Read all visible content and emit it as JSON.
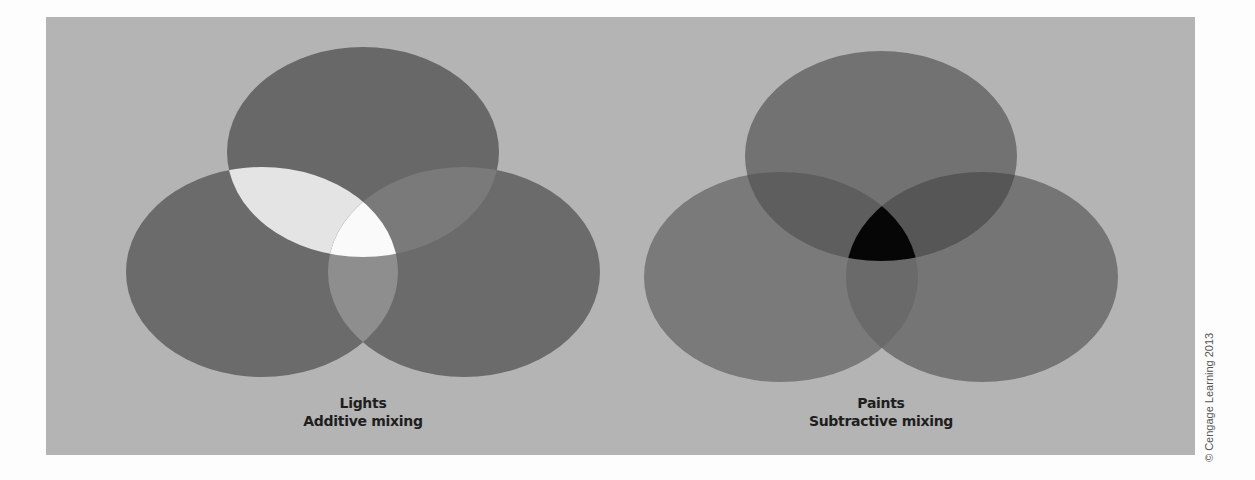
{
  "figure": {
    "background_color": "#b4b4b4",
    "page_color": "#fdfdfd",
    "credit": "© Cengage Learning 2013"
  },
  "diagrams": [
    {
      "id": "additive",
      "title": "Lights",
      "subtitle": "Additive mixing",
      "circle_color": "#6b6b6b",
      "pair_colors": {
        "top_left": "#e6e6e6",
        "top_right": "#7a7a7a",
        "left_right": "#8e8e8e"
      },
      "center_color": "#fafafa"
    },
    {
      "id": "subtractive",
      "title": "Paints",
      "subtitle": "Subtractive mixing",
      "circle_color": "#787878",
      "pair_colors": {
        "top_left": "#5c5c5c",
        "top_right": "#555555",
        "left_right": "#6c6c6c"
      },
      "center_color": "#050505"
    }
  ]
}
